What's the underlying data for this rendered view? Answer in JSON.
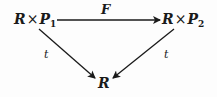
{
  "diagram": {
    "type": "commutative-triangle",
    "nodes": {
      "top_left": {
        "base": "R",
        "op": "×",
        "factor": "P",
        "sub": "1"
      },
      "top_right": {
        "base": "R",
        "op": "×",
        "factor": "P",
        "sub": "2"
      },
      "bottom": {
        "base": "R"
      }
    },
    "arrows": {
      "top": {
        "label": "F",
        "from": "top_left",
        "to": "top_right"
      },
      "left": {
        "label": "t",
        "from": "top_left",
        "to": "bottom"
      },
      "right": {
        "label": "t",
        "from": "top_right",
        "to": "bottom"
      }
    },
    "colors": {
      "ink": "#1a1a1a",
      "background": "#fdfdfd"
    }
  }
}
